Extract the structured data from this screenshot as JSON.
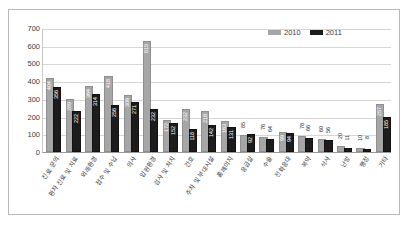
{
  "chart_data": {
    "type": "bar",
    "title": "",
    "xlabel": "",
    "ylabel": "",
    "ylim": [
      0,
      700
    ],
    "ytick_step": 100,
    "yticks": [
      0,
      100,
      200,
      300,
      400,
      500,
      600,
      700
    ],
    "grid": true,
    "legend_position": "top-right",
    "categories": [
      "진료 문의",
      "환자 진료 및 치료",
      "외래환경",
      "접수 및 수납",
      "의사",
      "입원환경",
      "검사 및 처치",
      "간호",
      "주차 및 부대시설",
      "홈페이지",
      "응급실",
      "수술",
      "전화응대",
      "복약",
      "식사",
      "난방",
      "행정",
      "기타"
    ],
    "series": [
      {
        "name": "2010",
        "color": "#a6a6a6",
        "values": [
          404,
          289,
          364,
          418,
          309,
          615,
          172,
          232,
          218,
          163,
          85,
          76,
          99,
          78,
          60,
          20,
          10,
          257
        ]
      },
      {
        "name": "2011",
        "color": "#1c1c1c",
        "values": [
          356,
          222,
          314,
          256,
          271,
          232,
          152,
          118,
          142,
          131,
          92,
          64,
          94,
          66,
          56,
          11,
          8,
          185
        ]
      }
    ]
  },
  "legend": {
    "items": [
      {
        "label": "2010",
        "color": "#a6a6a6"
      },
      {
        "label": "2011",
        "color": "#1c1c1c"
      }
    ]
  },
  "axis": {
    "ytick_labels": [
      "700",
      "600",
      "500",
      "400",
      "300",
      "200",
      "100",
      "0"
    ]
  }
}
